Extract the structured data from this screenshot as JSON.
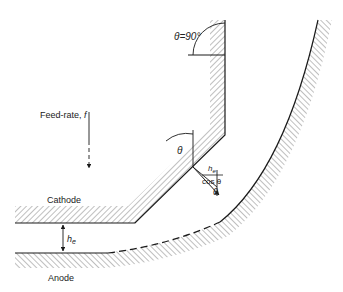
{
  "diagram": {
    "labels": {
      "theta_90": "θ=90°",
      "theta": "θ",
      "theta_lower": "θ",
      "feed_rate": "Feed-rate, ",
      "feed_rate_symbol": "f",
      "cathode": "Cathode",
      "anode": "Anode",
      "gap_symbol": "h",
      "gap_subscript": "e",
      "fraction_num_symbol": "h",
      "fraction_num_subscript": "e",
      "fraction_den": "cos θ"
    },
    "colors": {
      "line": "#1a1a1a",
      "hatch": "#8a8a8a",
      "text": "#222222"
    },
    "elements": [
      {
        "id": "cathode",
        "type": "hatched-boundary",
        "shape": "vertical segment, 45° chamfer, horizontal segment"
      },
      {
        "id": "anode",
        "type": "hatched-boundary",
        "shape": "horizontal segment, dashed transition, curved arc"
      },
      {
        "id": "feed-rate-arrow",
        "type": "arrow",
        "direction": "down",
        "style": "solid then dashed"
      },
      {
        "id": "gap-arrow",
        "type": "double-arrow",
        "label": "h_e"
      },
      {
        "id": "normal-gap-arrow",
        "type": "arrow",
        "label": "h_e / cos θ"
      }
    ]
  }
}
